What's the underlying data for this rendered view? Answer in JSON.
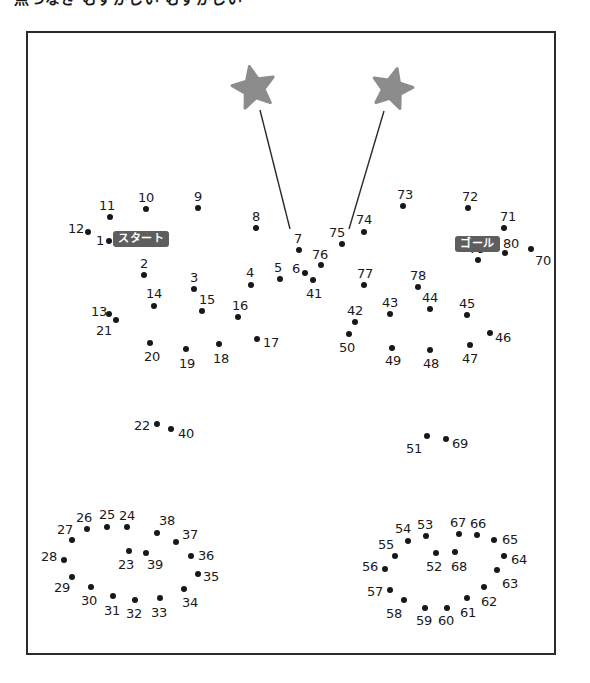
{
  "page": {
    "title": "点つなぎ むずかしい むずかしい",
    "type": "connect-the-dots-puzzle",
    "background_color": "#ffffff",
    "frame_color": "#2b2b2b",
    "dot_color": "#17181a",
    "number_color": "#1a1a1a",
    "star_color": "#8c8c8c",
    "pill_bg_color": "#5e5e5e",
    "pill_text_color": "#ffffff"
  },
  "labels": {
    "start": "スタート",
    "goal": "ゴール"
  },
  "stars": [
    {
      "name": "star-left",
      "cx": 254,
      "cy": 88,
      "r": 22,
      "rotate": -12
    },
    {
      "name": "star-right",
      "cx": 392,
      "cy": 89,
      "r": 21,
      "rotate": 14
    }
  ],
  "pointer_lines": [
    {
      "name": "pointer-line-left",
      "x1": 260,
      "y1": 110,
      "x2": 290,
      "y2": 229
    },
    {
      "name": "pointer-line-right",
      "x1": 384,
      "y1": 111,
      "x2": 349,
      "y2": 229
    }
  ],
  "pill_positions": [
    {
      "key": "start",
      "x": 113,
      "y": 239
    },
    {
      "key": "goal",
      "x": 455,
      "y": 244
    }
  ],
  "dots": [
    {
      "n": 1,
      "x": 109,
      "y": 241,
      "lx": 100,
      "ly": 240
    },
    {
      "n": 2,
      "x": 144,
      "y": 275,
      "lx": 144,
      "ly": 263
    },
    {
      "n": 3,
      "x": 194,
      "y": 289,
      "lx": 194,
      "ly": 277
    },
    {
      "n": 4,
      "x": 251,
      "y": 285,
      "lx": 250,
      "ly": 272
    },
    {
      "n": 5,
      "x": 280,
      "y": 279,
      "lx": 278,
      "ly": 267
    },
    {
      "n": 6,
      "x": 305,
      "y": 273,
      "lx": 296,
      "ly": 268
    },
    {
      "n": 7,
      "x": 299,
      "y": 250,
      "lx": 298,
      "ly": 238
    },
    {
      "n": 8,
      "x": 256,
      "y": 228,
      "lx": 256,
      "ly": 216
    },
    {
      "n": 9,
      "x": 198,
      "y": 208,
      "lx": 198,
      "ly": 196
    },
    {
      "n": 10,
      "x": 146,
      "y": 209,
      "lx": 146,
      "ly": 197
    },
    {
      "n": 11,
      "x": 110,
      "y": 217,
      "lx": 107,
      "ly": 205
    },
    {
      "n": 12,
      "x": 88,
      "y": 232,
      "lx": 76,
      "ly": 228
    },
    {
      "n": 13,
      "x": 109,
      "y": 314,
      "lx": 99,
      "ly": 311
    },
    {
      "n": 14,
      "x": 154,
      "y": 306,
      "lx": 154,
      "ly": 293
    },
    {
      "n": 15,
      "x": 202,
      "y": 311,
      "lx": 207,
      "ly": 299
    },
    {
      "n": 16,
      "x": 238,
      "y": 317,
      "lx": 240,
      "ly": 305
    },
    {
      "n": 17,
      "x": 257,
      "y": 339,
      "lx": 271,
      "ly": 342
    },
    {
      "n": 18,
      "x": 219,
      "y": 344,
      "lx": 221,
      "ly": 358
    },
    {
      "n": 19,
      "x": 186,
      "y": 349,
      "lx": 187,
      "ly": 363
    },
    {
      "n": 20,
      "x": 150,
      "y": 343,
      "lx": 152,
      "ly": 356
    },
    {
      "n": 21,
      "x": 116,
      "y": 320,
      "lx": 104,
      "ly": 330
    },
    {
      "n": 22,
      "x": 157,
      "y": 424,
      "lx": 142,
      "ly": 425
    },
    {
      "n": 23,
      "x": 129,
      "y": 551,
      "lx": 126,
      "ly": 564
    },
    {
      "n": 24,
      "x": 127,
      "y": 527,
      "lx": 127,
      "ly": 515
    },
    {
      "n": 25,
      "x": 107,
      "y": 527,
      "lx": 107,
      "ly": 514
    },
    {
      "n": 26,
      "x": 87,
      "y": 529,
      "lx": 84,
      "ly": 517
    },
    {
      "n": 27,
      "x": 72,
      "y": 540,
      "lx": 65,
      "ly": 529
    },
    {
      "n": 28,
      "x": 64,
      "y": 560,
      "lx": 49,
      "ly": 556
    },
    {
      "n": 29,
      "x": 72,
      "y": 577,
      "lx": 62,
      "ly": 587
    },
    {
      "n": 30,
      "x": 91,
      "y": 587,
      "lx": 89,
      "ly": 600
    },
    {
      "n": 31,
      "x": 113,
      "y": 596,
      "lx": 112,
      "ly": 610
    },
    {
      "n": 32,
      "x": 135,
      "y": 600,
      "lx": 134,
      "ly": 613
    },
    {
      "n": 33,
      "x": 160,
      "y": 598,
      "lx": 159,
      "ly": 612
    },
    {
      "n": 34,
      "x": 184,
      "y": 589,
      "lx": 190,
      "ly": 602
    },
    {
      "n": 35,
      "x": 198,
      "y": 574,
      "lx": 211,
      "ly": 576
    },
    {
      "n": 36,
      "x": 191,
      "y": 556,
      "lx": 206,
      "ly": 555
    },
    {
      "n": 37,
      "x": 176,
      "y": 542,
      "lx": 190,
      "ly": 534
    },
    {
      "n": 38,
      "x": 157,
      "y": 533,
      "lx": 167,
      "ly": 520
    },
    {
      "n": 39,
      "x": 146,
      "y": 553,
      "lx": 155,
      "ly": 564
    },
    {
      "n": 40,
      "x": 171,
      "y": 429,
      "lx": 186,
      "ly": 433
    },
    {
      "n": 41,
      "x": 313,
      "y": 280,
      "lx": 314,
      "ly": 293
    },
    {
      "n": 42,
      "x": 355,
      "y": 322,
      "lx": 355,
      "ly": 310
    },
    {
      "n": 43,
      "x": 390,
      "y": 314,
      "lx": 390,
      "ly": 302
    },
    {
      "n": 44,
      "x": 430,
      "y": 309,
      "lx": 430,
      "ly": 297
    },
    {
      "n": 45,
      "x": 467,
      "y": 315,
      "lx": 467,
      "ly": 303
    },
    {
      "n": 46,
      "x": 490,
      "y": 333,
      "lx": 503,
      "ly": 337
    },
    {
      "n": 47,
      "x": 470,
      "y": 345,
      "lx": 470,
      "ly": 358
    },
    {
      "n": 48,
      "x": 430,
      "y": 350,
      "lx": 431,
      "ly": 363
    },
    {
      "n": 49,
      "x": 392,
      "y": 348,
      "lx": 393,
      "ly": 360
    },
    {
      "n": 50,
      "x": 349,
      "y": 334,
      "lx": 347,
      "ly": 347
    },
    {
      "n": 51,
      "x": 427,
      "y": 436,
      "lx": 414,
      "ly": 448
    },
    {
      "n": 52,
      "x": 436,
      "y": 553,
      "lx": 434,
      "ly": 566
    },
    {
      "n": 53,
      "x": 426,
      "y": 536,
      "lx": 425,
      "ly": 524
    },
    {
      "n": 54,
      "x": 408,
      "y": 541,
      "lx": 403,
      "ly": 528
    },
    {
      "n": 55,
      "x": 395,
      "y": 556,
      "lx": 386,
      "ly": 544
    },
    {
      "n": 56,
      "x": 385,
      "y": 569,
      "lx": 370,
      "ly": 566
    },
    {
      "n": 57,
      "x": 390,
      "y": 590,
      "lx": 375,
      "ly": 591
    },
    {
      "n": 58,
      "x": 404,
      "y": 600,
      "lx": 394,
      "ly": 613
    },
    {
      "n": 59,
      "x": 425,
      "y": 608,
      "lx": 424,
      "ly": 620
    },
    {
      "n": 60,
      "x": 447,
      "y": 608,
      "lx": 446,
      "ly": 620
    },
    {
      "n": 61,
      "x": 467,
      "y": 598,
      "lx": 468,
      "ly": 612
    },
    {
      "n": 62,
      "x": 484,
      "y": 587,
      "lx": 489,
      "ly": 601
    },
    {
      "n": 63,
      "x": 497,
      "y": 570,
      "lx": 510,
      "ly": 583
    },
    {
      "n": 64,
      "x": 504,
      "y": 556,
      "lx": 519,
      "ly": 559
    },
    {
      "n": 65,
      "x": 494,
      "y": 540,
      "lx": 510,
      "ly": 539
    },
    {
      "n": 66,
      "x": 477,
      "y": 535,
      "lx": 478,
      "ly": 523
    },
    {
      "n": 67,
      "x": 459,
      "y": 534,
      "lx": 458,
      "ly": 522
    },
    {
      "n": 68,
      "x": 455,
      "y": 552,
      "lx": 459,
      "ly": 566
    },
    {
      "n": 69,
      "x": 446,
      "y": 439,
      "lx": 460,
      "ly": 443
    },
    {
      "n": 70,
      "x": 531,
      "y": 249,
      "lx": 543,
      "ly": 260
    },
    {
      "n": 71,
      "x": 504,
      "y": 228,
      "lx": 508,
      "ly": 216
    },
    {
      "n": 72,
      "x": 468,
      "y": 208,
      "lx": 470,
      "ly": 196
    },
    {
      "n": 73,
      "x": 403,
      "y": 206,
      "lx": 405,
      "ly": 194
    },
    {
      "n": 74,
      "x": 364,
      "y": 232,
      "lx": 364,
      "ly": 219
    },
    {
      "n": 75,
      "x": 342,
      "y": 244,
      "lx": 337,
      "ly": 232
    },
    {
      "n": 76,
      "x": 321,
      "y": 265,
      "lx": 320,
      "ly": 254
    },
    {
      "n": 77,
      "x": 364,
      "y": 285,
      "lx": 365,
      "ly": 273
    },
    {
      "n": 78,
      "x": 418,
      "y": 287,
      "lx": 418,
      "ly": 275
    },
    {
      "n": 79,
      "x": 478,
      "y": 260,
      "lx": 477,
      "ly": 248
    },
    {
      "n": 80,
      "x": 505,
      "y": 253,
      "lx": 511,
      "ly": 243
    }
  ]
}
